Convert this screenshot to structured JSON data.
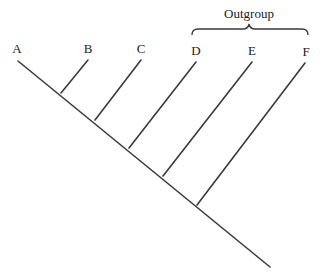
{
  "diagram": {
    "type": "cladogram",
    "group_label": "Outgroup",
    "taxa": [
      {
        "label": "A",
        "tip": [
          18,
          58
        ],
        "node": [
          270,
          267
        ]
      },
      {
        "label": "B",
        "tip": [
          88,
          58
        ],
        "node": [
          61,
          93
        ]
      },
      {
        "label": "C",
        "tip": [
          141,
          58
        ],
        "node": [
          95,
          120
        ]
      },
      {
        "label": "D",
        "tip": [
          196,
          60
        ],
        "node": [
          129,
          148
        ]
      },
      {
        "label": "E",
        "tip": [
          252,
          60
        ],
        "node": [
          163,
          176
        ]
      },
      {
        "label": "F",
        "tip": [
          305,
          61
        ],
        "node": [
          197,
          205
        ]
      }
    ],
    "outgroup_members": [
      "D",
      "E",
      "F"
    ],
    "line_color": "#3a3a3a"
  }
}
